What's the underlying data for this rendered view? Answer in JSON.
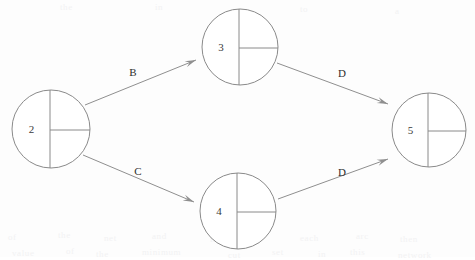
{
  "diagram": {
    "type": "directed-graph",
    "background_color": "#fdfdfd",
    "stroke_color": "#8a8a8a",
    "text_color": "#2e2e2e",
    "nodes": [
      {
        "id": "2",
        "label": "2",
        "cx": 51,
        "cy": 129,
        "r": 39,
        "split_x_offset": -1,
        "split_y_offset": 1
      },
      {
        "id": "3",
        "label": "3",
        "cx": 240,
        "cy": 47,
        "r": 38,
        "split_x_offset": -1,
        "split_y_offset": 1
      },
      {
        "id": "4",
        "label": "4",
        "cx": 238,
        "cy": 211,
        "r": 38,
        "split_x_offset": -1,
        "split_y_offset": 1
      },
      {
        "id": "5",
        "label": "5",
        "cx": 429,
        "cy": 130,
        "r": 37,
        "split_x_offset": -1,
        "split_y_offset": 1
      }
    ],
    "edges": [
      {
        "id": "edge-2-3",
        "from": "2",
        "to": "3",
        "label": "B",
        "x1": 85,
        "y1": 105,
        "x2": 196,
        "y2": 60,
        "label_x": 133,
        "label_y": 73
      },
      {
        "id": "edge-2-4",
        "from": "2",
        "to": "4",
        "label": "C",
        "x1": 83,
        "y1": 155,
        "x2": 194,
        "y2": 202,
        "label_x": 138,
        "label_y": 172
      },
      {
        "id": "edge-3-5",
        "from": "3",
        "to": "5",
        "label": "D",
        "x1": 277,
        "y1": 63,
        "x2": 388,
        "y2": 104,
        "label_x": 342,
        "label_y": 74
      },
      {
        "id": "edge-4-5",
        "from": "4",
        "to": "5",
        "label": "D",
        "x1": 278,
        "y1": 199,
        "x2": 388,
        "y2": 159,
        "label_x": 342,
        "label_y": 173
      }
    ],
    "ghost_artifacts": [
      {
        "text": "the",
        "x": 60,
        "y": 2
      },
      {
        "text": "in",
        "x": 155,
        "y": 2
      },
      {
        "text": "to",
        "x": 300,
        "y": 4
      },
      {
        "text": "a",
        "x": 395,
        "y": 6
      },
      {
        "text": "of",
        "x": 8,
        "y": 232
      },
      {
        "text": "the",
        "x": 58,
        "y": 230
      },
      {
        "text": "net",
        "x": 104,
        "y": 233
      },
      {
        "text": "and",
        "x": 152,
        "y": 231
      },
      {
        "text": "is",
        "x": 210,
        "y": 234
      },
      {
        "text": "for",
        "x": 252,
        "y": 230
      },
      {
        "text": "each",
        "x": 300,
        "y": 233
      },
      {
        "text": "arc",
        "x": 356,
        "y": 231
      },
      {
        "text": "then",
        "x": 400,
        "y": 234
      },
      {
        "text": "value",
        "x": 12,
        "y": 248
      },
      {
        "text": "of",
        "x": 66,
        "y": 246
      },
      {
        "text": "the",
        "x": 96,
        "y": 249
      },
      {
        "text": "minimum",
        "x": 142,
        "y": 247
      },
      {
        "text": "cut",
        "x": 228,
        "y": 250
      },
      {
        "text": "set",
        "x": 272,
        "y": 247
      },
      {
        "text": "in",
        "x": 318,
        "y": 249
      },
      {
        "text": "this",
        "x": 350,
        "y": 247
      },
      {
        "text": "network",
        "x": 398,
        "y": 250
      }
    ]
  }
}
